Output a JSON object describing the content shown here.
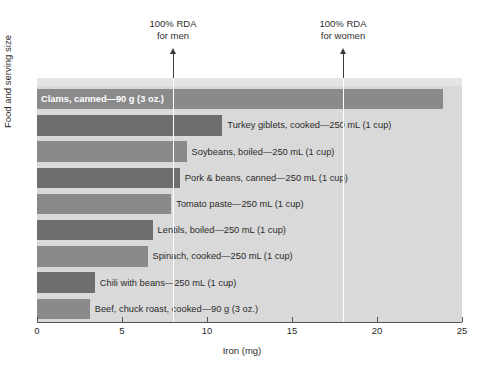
{
  "chart_data": {
    "type": "bar",
    "orientation": "horizontal",
    "title": "",
    "xlabel": "Iron (mg)",
    "ylabel": "Food and serving size",
    "xlim": [
      0,
      25
    ],
    "xticks": [
      0,
      5,
      10,
      15,
      20,
      25
    ],
    "xtick_labels": [
      "0",
      "5",
      "10",
      "15",
      "20",
      "25"
    ],
    "grid": false,
    "legend": "none",
    "categories": [
      "Clams, canned—90 g (3 oz.)",
      "Turkey giblets, cooked—250 mL (1 cup)",
      "Soybeans, boiled—250 mL (1 cup)",
      "Pork & beans, canned—250 mL (1 cup)",
      "Tomato paste—250 mL (1 cup)",
      "Lentils, boiled—250 mL (1 cup)",
      "Spinach, cooked—250 mL (1 cup)",
      "Chili with beans—250 mL (1 cup)",
      "Beef, chuck roast, cooked—90 g (3 oz.)"
    ],
    "values": [
      23.9,
      10.9,
      8.8,
      8.4,
      7.9,
      6.8,
      6.5,
      3.4,
      3.1
    ],
    "bars": [
      {
        "label": "Clams, canned—90 g (3 oz.)",
        "value": 23.9,
        "color": "#8a8a8a",
        "label_position": "inside"
      },
      {
        "label": "Turkey giblets, cooked—250 mL (1 cup)",
        "value": 10.9,
        "color": "#6e6e6e",
        "label_position": "outside"
      },
      {
        "label": "Soybeans, boiled—250 mL (1 cup)",
        "value": 8.8,
        "color": "#8a8a8a",
        "label_position": "outside"
      },
      {
        "label": "Pork & beans, canned—250 mL (1 cup)",
        "value": 8.4,
        "color": "#6e6e6e",
        "label_position": "outside"
      },
      {
        "label": "Tomato paste—250 mL (1 cup)",
        "value": 7.9,
        "color": "#8a8a8a",
        "label_position": "outside"
      },
      {
        "label": "Lentils, boiled—250 mL (1 cup)",
        "value": 6.8,
        "color": "#6e6e6e",
        "label_position": "outside"
      },
      {
        "label": "Spinach, cooked—250 mL (1 cup)",
        "value": 6.5,
        "color": "#8a8a8a",
        "label_position": "outside"
      },
      {
        "label": "Chili with beans—250 mL (1 cup)",
        "value": 3.4,
        "color": "#6e6e6e",
        "label_position": "outside"
      },
      {
        "label": "Beef, chuck roast, cooked—90 g (3 oz.)",
        "value": 3.1,
        "color": "#8a8a8a",
        "label_position": "outside"
      }
    ],
    "annotations": [
      {
        "line1": "100% RDA",
        "line2": "for men",
        "value": 8.0,
        "marker": "up-arrow"
      },
      {
        "line1": "100% RDA",
        "line2": "for women",
        "value": 18.0,
        "marker": "up-arrow"
      }
    ],
    "colors": {
      "plot_background": "#d9d9d9",
      "plot_top_strip": "#e4e4e4",
      "bar_light": "#8a8a8a",
      "bar_dark": "#6e6e6e",
      "guide_line": "#ffffff",
      "axis": "#555555",
      "text": "#2b2b2b"
    }
  }
}
